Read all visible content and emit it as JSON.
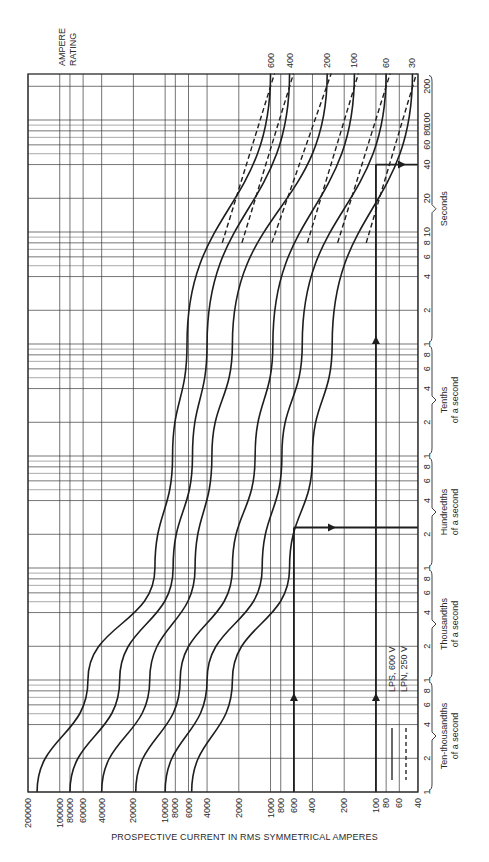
{
  "chart_data": {
    "type": "line",
    "title": "",
    "orientation": "rotated 90° (current on horizontal axis, decreasing left-to-right; time on vertical axis increasing upward)",
    "xlabel": "PROSPECTIVE CURRENT IN RMS SYMMETRICAL AMPERES",
    "ylabel": "Time",
    "xscale": "log",
    "yscale": "log",
    "xlim": [
      200000,
      40
    ],
    "ylim_seconds": [
      0.0001,
      260
    ],
    "grid": true,
    "x_tick_labels": [
      "200000",
      "100000",
      "80000",
      "60000",
      "40000",
      "20000",
      "10000",
      "8000",
      "6000",
      "4000",
      "2000",
      "1000",
      "800",
      "600",
      "400",
      "200",
      "100",
      "80",
      "60",
      "40"
    ],
    "x_tick_values": [
      200000,
      100000,
      80000,
      60000,
      40000,
      20000,
      10000,
      8000,
      6000,
      4000,
      2000,
      1000,
      800,
      600,
      400,
      200,
      100,
      80,
      60,
      40
    ],
    "y_tick_groups": [
      {
        "label": "Ten-thousandths of a second",
        "ticks": [
          "1",
          "2",
          "4",
          "6",
          "8",
          "1"
        ]
      },
      {
        "label": "Thousandths of a second",
        "ticks": [
          "2",
          "4",
          "6",
          "8",
          "1"
        ]
      },
      {
        "label": "Hundredths of a second",
        "ticks": [
          "2",
          "4",
          "6",
          "8",
          "1"
        ]
      },
      {
        "label": "Tenths of a second",
        "ticks": [
          "2",
          "4",
          "6",
          "8",
          "1"
        ]
      },
      {
        "label": "Seconds",
        "ticks": [
          "2",
          "4",
          "6",
          "8",
          "10",
          "20",
          "40",
          "60",
          "80",
          "100",
          "200"
        ]
      }
    ],
    "series_label_header": "AMPERE RATING",
    "legend": [
      {
        "name": "LPS, 600 V",
        "style": "solid"
      },
      {
        "name": "LPN, 250 V",
        "style": "dashed"
      }
    ],
    "series": [
      {
        "name": "600",
        "points": [
          [
            164000,
            0.0001
          ],
          [
            54000,
            0.001
          ],
          [
            12500,
            0.01
          ],
          [
            8500,
            0.1
          ],
          [
            6200,
            1
          ],
          [
            1000,
            260
          ]
        ]
      },
      {
        "name": "400",
        "points": [
          [
            80000,
            0.0001
          ],
          [
            27000,
            0.001
          ],
          [
            8400,
            0.01
          ],
          [
            5500,
            0.1
          ],
          [
            4000,
            1
          ],
          [
            660,
            260
          ]
        ]
      },
      {
        "name": "200",
        "points": [
          [
            40000,
            0.0001
          ],
          [
            14000,
            0.001
          ],
          [
            5200,
            0.01
          ],
          [
            3600,
            0.1
          ],
          [
            2300,
            1
          ],
          [
            290,
            260
          ]
        ]
      },
      {
        "name": "100",
        "points": [
          [
            19000,
            0.0001
          ],
          [
            7200,
            0.001
          ],
          [
            2300,
            0.01
          ],
          [
            1400,
            0.1
          ],
          [
            950,
            1
          ],
          [
            160,
            260
          ]
        ]
      },
      {
        "name": "60",
        "points": [
          [
            10000,
            0.0001
          ],
          [
            4000,
            0.001
          ],
          [
            1200,
            0.01
          ],
          [
            780,
            0.1
          ],
          [
            500,
            1
          ],
          [
            80,
            260
          ]
        ]
      },
      {
        "name": "30",
        "points": [
          [
            5600,
            0.0001
          ],
          [
            2300,
            0.001
          ],
          [
            660,
            0.01
          ],
          [
            400,
            0.1
          ],
          [
            260,
            1
          ],
          [
            45,
            260
          ]
        ]
      }
    ],
    "annotations": [
      {
        "type": "arrow-line",
        "description": "Vertical line at 600 A with upward arrows, turning right at ~0.023 s (intersection with 30 A curve)",
        "current": 600,
        "time": 0.023
      },
      {
        "type": "arrow-line",
        "description": "Vertical line at 100 A with upward arrows, turning right at ~40 s (intersection with 30 A curve)",
        "current": 100,
        "time": 40
      }
    ]
  },
  "labels": {
    "ampere_rating_line1": "AMPERE",
    "ampere_rating_line2": "RATING",
    "xlabel": "PROSPECTIVE CURRENT IN RMS SYMMETRICAL AMPERES",
    "legend_solid": "LPS, 600 V",
    "legend_dashed": "LPN, 250 V"
  }
}
